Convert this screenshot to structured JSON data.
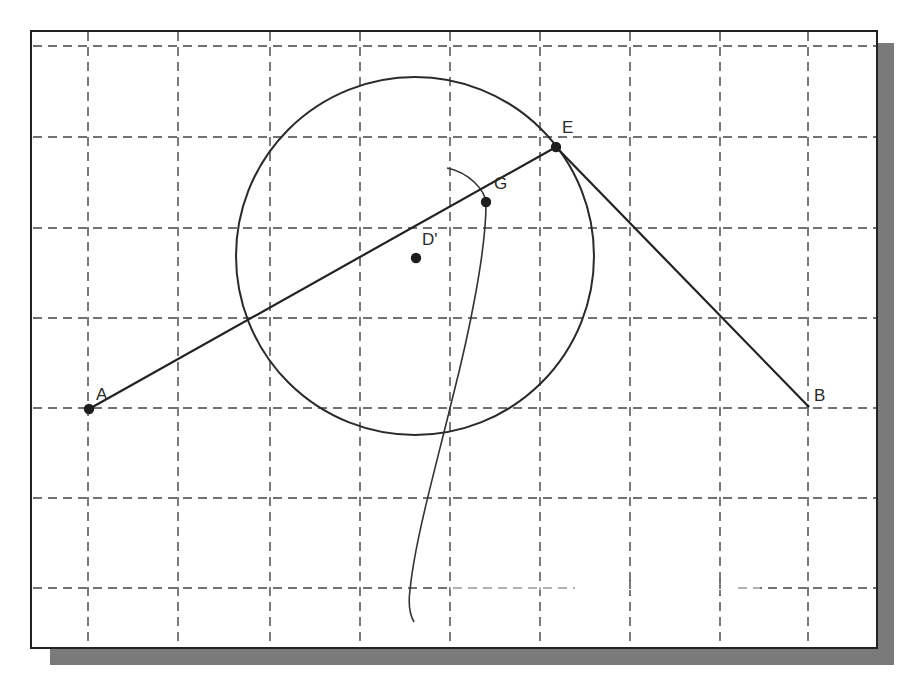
{
  "frame": {
    "x": 31,
    "y": 31,
    "width": 846,
    "height": 617,
    "border_color": "#222222",
    "shadow_color": "#7a7a7a",
    "shadow_offset": 17
  },
  "grid": {
    "color": "#444444",
    "dash": "9 6",
    "vertical_x": [
      88,
      178,
      270,
      360,
      450,
      540,
      630,
      720,
      808
    ],
    "horizontal_y": [
      46,
      137,
      228,
      318,
      408,
      498,
      588
    ],
    "faded_segments": [
      {
        "x1": 450,
        "y1": 588,
        "x2": 580,
        "y2": 588
      },
      {
        "x1": 720,
        "y1": 588,
        "x2": 760,
        "y2": 588
      }
    ],
    "gap_segment": {
      "x1": 575,
      "y1": 588,
      "x2": 735,
      "y2": 588
    }
  },
  "circle": {
    "cx": 415,
    "cy": 256,
    "r": 179,
    "stroke": "#2a2a2a"
  },
  "points": [
    {
      "id": "A",
      "label": "A",
      "x": 89,
      "y": 409,
      "dot": true,
      "label_dx": 7,
      "label_dy": -9
    },
    {
      "id": "Dprime",
      "label": "D'",
      "x": 416,
      "y": 258,
      "dot": true,
      "label_dx": 6,
      "label_dy": -13
    },
    {
      "id": "G",
      "label": "G",
      "x": 486,
      "y": 202,
      "dot": true,
      "label_dx": 8,
      "label_dy": -13
    },
    {
      "id": "E",
      "label": "E",
      "x": 556,
      "y": 147,
      "dot": true,
      "label_dx": 6,
      "label_dy": -14
    },
    {
      "id": "B",
      "label": "B",
      "x": 808,
      "y": 406,
      "dot": false,
      "label_dx": 6,
      "label_dy": -5
    }
  ],
  "segments": [
    {
      "from": "A",
      "to": "E"
    },
    {
      "from": "E",
      "to": "B"
    }
  ],
  "curve": {
    "path": "M447,168 C468,172 486,190 486,204 C486,250 470,330 452,400 C435,470 415,540 410,590 C408,605 410,615 414,622",
    "stroke": "#333333"
  }
}
